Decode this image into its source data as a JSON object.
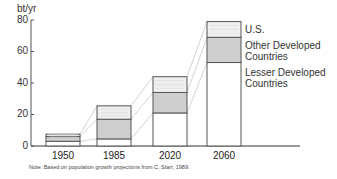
{
  "chart_data": {
    "type": "bar",
    "stacked": true,
    "title": "",
    "xlabel": "",
    "ylabel": "bt/yr",
    "ylim": [
      0,
      80
    ],
    "yticks": [
      0,
      20,
      40,
      60,
      80
    ],
    "categories": [
      "1950",
      "1985",
      "2020",
      "2060"
    ],
    "series": [
      {
        "name": "Lesser Developed Countries",
        "values": [
          3,
          4.5,
          21,
          53
        ],
        "color": "#ffffff"
      },
      {
        "name": "Other Developed Countries",
        "values": [
          3,
          12.5,
          13,
          16
        ],
        "color": "#cfcfcf"
      },
      {
        "name": "U.S.",
        "values": [
          1.5,
          8.5,
          10,
          10
        ],
        "color": "#efefef"
      }
    ],
    "totals": [
      7.5,
      25,
      44,
      79
    ],
    "legend_position": "right of last bar",
    "grid": false,
    "connector_lines": true,
    "note": "Note: Based on population growth projections from C. Starr, 1989."
  },
  "axis": {
    "unit_label": "bt/yr",
    "y_tick_labels": [
      "80",
      "60",
      "40",
      "20",
      "0"
    ],
    "x_tick_labels": [
      "1950",
      "1985",
      "2020",
      "2060"
    ]
  },
  "legend": {
    "us": "U.S.",
    "other_line1": "Other Developed",
    "other_line2": "Countries",
    "ldc_line1": "Lesser Developed",
    "ldc_line2": "Countries"
  },
  "note": "Note: Based on population growth projections from C. Starr, 1989."
}
